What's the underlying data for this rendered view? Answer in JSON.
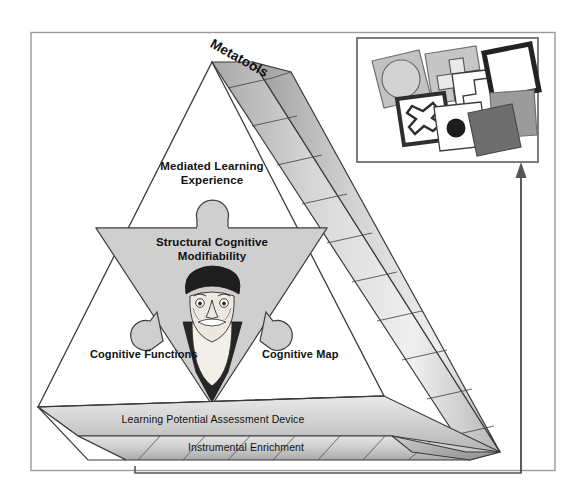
{
  "figure": {
    "title_label": "Metatools",
    "levels": [
      {
        "id": "metatools",
        "label": "Metatools"
      },
      {
        "id": "mediated-learning-experience",
        "label": "Mediated Learning\nExperience",
        "line1": "Mediated Learning",
        "line2": "Experience"
      },
      {
        "id": "structural-cognitive-modifiability",
        "label": "Structural Cognitive\nModifiability",
        "line1": "Structural Cognitive",
        "line2": "Modifiability"
      },
      {
        "id": "cognitive-functions",
        "label": "Cognitive Functions"
      },
      {
        "id": "cognitive-map",
        "label": "Cognitive Map"
      },
      {
        "id": "learning-potential-assessment-device",
        "label": "Learning Potential Assessment Device"
      },
      {
        "id": "instrumental-enrichment",
        "label": "Instrumental Enrichment"
      }
    ],
    "labels": {
      "metatools": "Metatools",
      "mle_line1": "Mediated Learning",
      "mle_line2": "Experience",
      "scm_line1": "Structural Cognitive",
      "scm_line2": "Modifiability",
      "cognitive_functions": "Cognitive Functions",
      "cognitive_map": "Cognitive Map",
      "lpad": "Learning Potential Assessment Device",
      "instrumental_enrichment": "Instrumental Enrichment"
    },
    "portrait": {
      "name": "bearded-scholar-portrait",
      "description": "Elderly bearded man wearing a dark beret"
    },
    "inset": {
      "name": "shape-cards-inset",
      "description": "Overlapping cards printed with geometric shapes",
      "cards": [
        {
          "shape": "circle",
          "fill": "#b8b8b8",
          "stroke": "#6f6f6f"
        },
        {
          "shape": "cross",
          "fill": "#b8b8b8",
          "stroke": "#6f6f6f"
        },
        {
          "shape": "cross",
          "fill": "#ffffff",
          "stroke": "#3a3a3a"
        },
        {
          "shape": "x-in-square",
          "fill": "#ffffff",
          "stroke": "#3a3a3a"
        },
        {
          "shape": "filled-dot",
          "fill": "#ffffff",
          "stroke": "#3a3a3a"
        },
        {
          "shape": "open-square",
          "fill": "#ffffff",
          "stroke": "#2b2b2b"
        },
        {
          "shape": "solid-square-mid",
          "fill": "#9a9a9a",
          "stroke": "#6f6f6f"
        },
        {
          "shape": "solid-square-dark",
          "fill": "#6d6d6d",
          "stroke": "#4a4a4a"
        }
      ]
    },
    "arrow": {
      "name": "feedback-arrow",
      "direction": "up",
      "from": "instrumental-enrichment",
      "to": "shape-cards-inset"
    },
    "colors": {
      "frame_stroke": "#9a9a9a",
      "outline": "#3b3b3b",
      "band_light": "#f1f1f1",
      "band_mid": "#c9c9c9",
      "band_dark": "#9d9d9d",
      "inner_triangle": "#cfcfcf",
      "text": "#111111",
      "portrait_dark": "#2a2a2a",
      "portrait_skin": "#e8e4dd"
    }
  }
}
